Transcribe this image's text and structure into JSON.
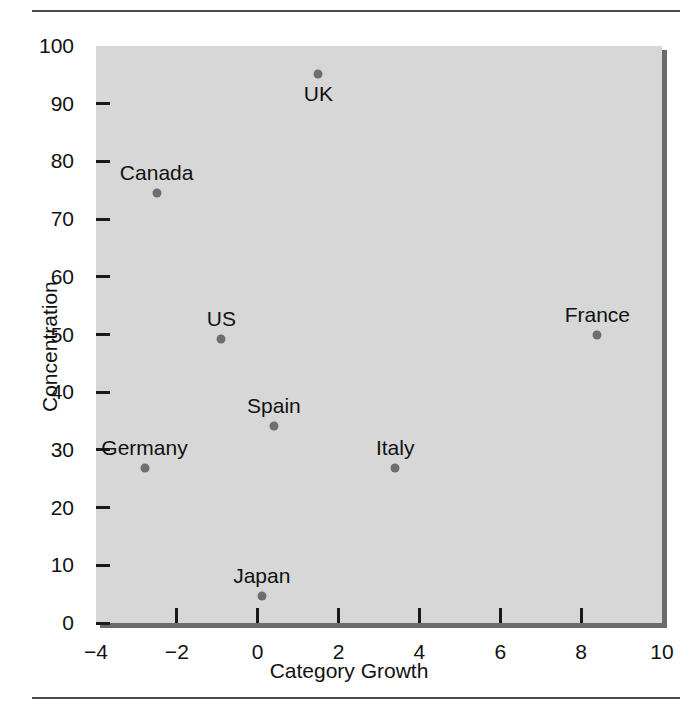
{
  "chart_data": {
    "type": "scatter",
    "title": "",
    "xlabel": "Category Growth",
    "ylabel": "Concentration",
    "xlim": [
      -4,
      10
    ],
    "ylim": [
      0,
      100
    ],
    "xticks": [
      "-4",
      "-2",
      "0",
      "2",
      "4",
      "6",
      "8",
      "10"
    ],
    "xtick_values": [
      -4,
      -2,
      0,
      2,
      4,
      6,
      8,
      10
    ],
    "yticks": [
      "0",
      "10",
      "20",
      "30",
      "40",
      "50",
      "60",
      "70",
      "80",
      "90",
      "100"
    ],
    "ytick_values": [
      0,
      10,
      20,
      30,
      40,
      50,
      60,
      70,
      80,
      90,
      100
    ],
    "grid": false,
    "legend": "none",
    "marker_color": "#6e6e6e",
    "plot_background": "#d7d7d7",
    "points": [
      {
        "label": "UK",
        "x": 1.5,
        "y": 95.1,
        "label_pos": "below"
      },
      {
        "label": "Canada",
        "x": -2.5,
        "y": 74.5,
        "label_pos": "above"
      },
      {
        "label": "France",
        "x": 8.4,
        "y": 49.9,
        "label_pos": "above"
      },
      {
        "label": "US",
        "x": -0.9,
        "y": 49.2,
        "label_pos": "above"
      },
      {
        "label": "Spain",
        "x": 0.4,
        "y": 34.2,
        "label_pos": "above"
      },
      {
        "label": "Italy",
        "x": 3.4,
        "y": 26.8,
        "label_pos": "above"
      },
      {
        "label": "Germany",
        "x": -2.8,
        "y": 26.8,
        "label_pos": "above"
      },
      {
        "label": "Japan",
        "x": 0.1,
        "y": 4.6,
        "label_pos": "above"
      }
    ]
  }
}
